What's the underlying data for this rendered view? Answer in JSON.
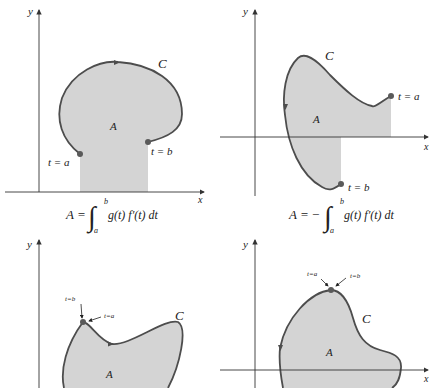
{
  "colors": {
    "region_fill": "#d4d4d4",
    "curve_stroke": "#4d4d4d",
    "axis_stroke": "#333333",
    "point_fill": "#5a5a5a",
    "background": "#ffffff"
  },
  "panels": [
    {
      "id": "top-left",
      "axis_labels": {
        "x": "x",
        "y": "y"
      },
      "curve_label": "C",
      "region_label": "A",
      "points": [
        {
          "label": "t = a"
        },
        {
          "label": "t = b"
        }
      ],
      "formula": {
        "lhs": "A =",
        "sign": "",
        "integral": "∫",
        "upper": "b",
        "lower": "a",
        "integrand": "g(t) f′(t) dt"
      }
    },
    {
      "id": "top-right",
      "axis_labels": {
        "x": "x",
        "y": "y"
      },
      "curve_label": "C",
      "region_label": "A",
      "points": [
        {
          "label": "t = a"
        },
        {
          "label": "t = b"
        }
      ],
      "formula": {
        "lhs": "A =",
        "sign": "−",
        "integral": "∫",
        "upper": "b",
        "lower": "a",
        "integrand": "g(t) f′(t) dt"
      }
    },
    {
      "id": "bottom-left",
      "axis_labels": {
        "y": "y"
      },
      "curve_label": "C",
      "region_label": "A",
      "points": [
        {
          "label": "t=b"
        },
        {
          "label": "t=a"
        }
      ]
    },
    {
      "id": "bottom-right",
      "axis_labels": {
        "x": "x",
        "y": "y"
      },
      "curve_label": "C",
      "region_label": "A",
      "points": [
        {
          "label": "t=a"
        },
        {
          "label": "t=b"
        }
      ]
    }
  ]
}
